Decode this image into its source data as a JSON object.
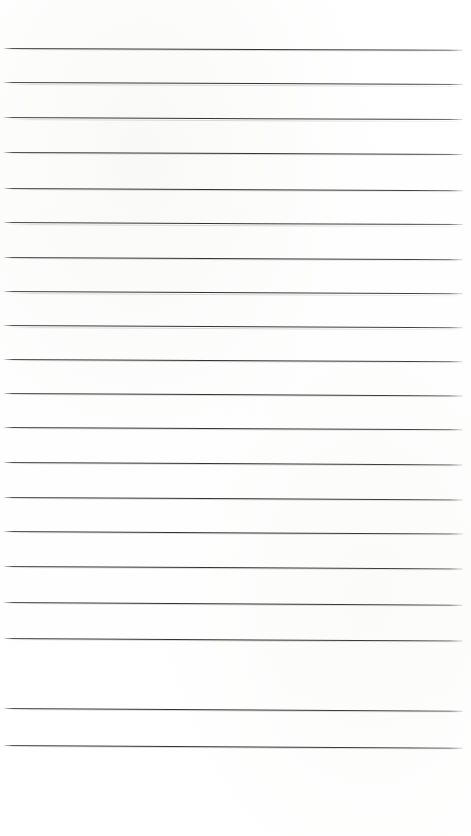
{
  "document": {
    "kind": "lined-paper-sheet",
    "title": "Blank ruled notebook page",
    "content_text": "",
    "is_blank": true,
    "page_width": 471,
    "page_height": 836,
    "background_color": "#ffffff",
    "rule_color": "#3c3c3c",
    "rule_thickness_px": 1.25,
    "rule_count": 20,
    "rule_spacing_px": 34.7,
    "first_rule_y": 48,
    "last_rule_y": 745,
    "top_margin_px": 46,
    "bottom_margin_px": 91,
    "rule_left_x": 3,
    "rule_right_x": 463,
    "skew_degrees": 0.25,
    "rules": [
      {
        "index": 1,
        "y": 48,
        "skew": 0.22,
        "text": ""
      },
      {
        "index": 2,
        "y": 82.5,
        "skew": 0.24,
        "text": ""
      },
      {
        "index": 3,
        "y": 117.5,
        "skew": 0.26,
        "text": ""
      },
      {
        "index": 4,
        "y": 152,
        "skew": 0.25,
        "text": ""
      },
      {
        "index": 5,
        "y": 188,
        "skew": 0.27,
        "text": ""
      },
      {
        "index": 6,
        "y": 222.5,
        "skew": 0.26,
        "text": ""
      },
      {
        "index": 7,
        "y": 257,
        "skew": 0.28,
        "text": ""
      },
      {
        "index": 8,
        "y": 291.5,
        "skew": 0.27,
        "text": ""
      },
      {
        "index": 9,
        "y": 325.5,
        "skew": 0.29,
        "text": ""
      },
      {
        "index": 10,
        "y": 359,
        "skew": 0.28,
        "text": ""
      },
      {
        "index": 11,
        "y": 393,
        "skew": 0.3,
        "text": ""
      },
      {
        "index": 12,
        "y": 427,
        "skew": 0.29,
        "text": ""
      },
      {
        "index": 13,
        "y": 462,
        "skew": 0.31,
        "text": ""
      },
      {
        "index": 14,
        "y": 497,
        "skew": 0.3,
        "text": ""
      },
      {
        "index": 15,
        "y": 531,
        "skew": 0.32,
        "text": ""
      },
      {
        "index": 16,
        "y": 566,
        "skew": 0.31,
        "text": ""
      },
      {
        "index": 17,
        "y": 602,
        "skew": 0.33,
        "text": ""
      },
      {
        "index": 18,
        "y": 638,
        "skew": 0.32,
        "text": ""
      },
      {
        "index": 19,
        "y": 708,
        "skew": 0.34,
        "text": ""
      },
      {
        "index": 20,
        "y": 745,
        "skew": 0.33,
        "text": ""
      }
    ]
  }
}
